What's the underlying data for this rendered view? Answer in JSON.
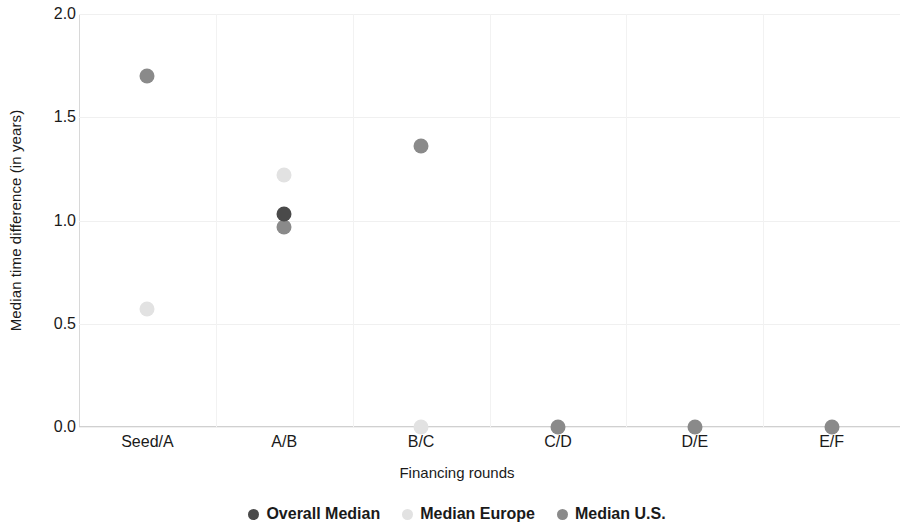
{
  "chart_data": {
    "type": "scatter",
    "title": "",
    "xlabel": "Financing rounds",
    "ylabel": "Median time difference (in years)",
    "categories": [
      "Seed/A",
      "A/B",
      "B/C",
      "C/D",
      "D/E",
      "E/F"
    ],
    "ylim": [
      0.0,
      2.0
    ],
    "yticks": [
      0.0,
      0.5,
      1.0,
      1.5,
      2.0
    ],
    "ytick_labels": [
      "0.0",
      "0.5",
      "1.0",
      "1.5",
      "2.0"
    ],
    "grid": true,
    "legend_position": "bottom-center",
    "series": [
      {
        "name": "Overall Median",
        "color": "#4a4a4a",
        "values": [
          null,
          1.03,
          null,
          null,
          null,
          null
        ]
      },
      {
        "name": "Median Europe",
        "color": "#e2e2e2",
        "values": [
          0.57,
          1.22,
          0.0,
          null,
          null,
          null
        ]
      },
      {
        "name": "Median U.S.",
        "color": "#8a8a8a",
        "values": [
          1.7,
          0.97,
          1.36,
          0.0,
          0.0,
          0.0
        ]
      }
    ]
  },
  "axes": {
    "y_title": "Median time difference (in years)",
    "x_title": "Financing rounds",
    "y_ticks": [
      "2.0",
      "1.5",
      "1.0",
      "0.5",
      "0.0"
    ],
    "x_ticks": [
      "Seed/A",
      "A/B",
      "B/C",
      "C/D",
      "D/E",
      "E/F"
    ]
  },
  "legend": {
    "items": [
      {
        "label": "Overall Median",
        "color": "#4a4a4a"
      },
      {
        "label": "Median Europe",
        "color": "#e2e2e2"
      },
      {
        "label": "Median U.S.",
        "color": "#8a8a8a"
      }
    ]
  }
}
